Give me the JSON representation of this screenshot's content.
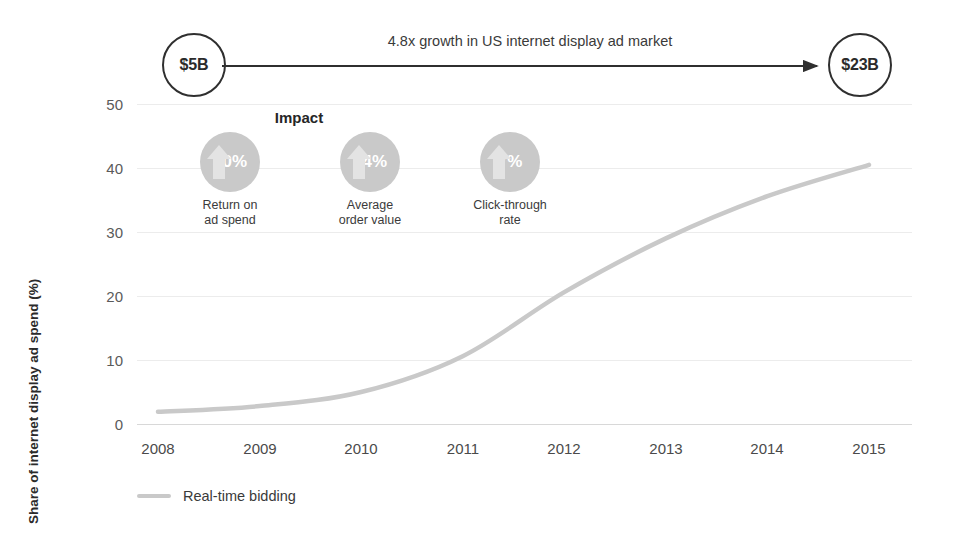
{
  "growth": {
    "start_label": "$5B",
    "end_label": "$23B",
    "caption": "4.8x growth in US internet display ad market"
  },
  "impact": {
    "title": "Impact",
    "items": [
      {
        "value": "30%",
        "label_line1": "Return on",
        "label_line2": "ad spend",
        "icon": "up-arrow-icon"
      },
      {
        "value": "24%",
        "label_line1": "Average",
        "label_line2": "order value",
        "icon": "up-arrow-icon"
      },
      {
        "value": "7%",
        "label_line1": "Click-through",
        "label_line2": "rate",
        "icon": "up-arrow-icon"
      }
    ]
  },
  "legend": {
    "entries": [
      {
        "label": "Real-time bidding",
        "color": "#c9c9c9"
      }
    ]
  },
  "axis": {
    "y_title": "Share of internet display ad spend (%)",
    "y_ticks": [
      "0",
      "10",
      "20",
      "30",
      "40",
      "50"
    ],
    "x_ticks": [
      "2008",
      "2009",
      "2010",
      "2011",
      "2012",
      "2013",
      "2014",
      "2015"
    ]
  },
  "colors": {
    "series_line": "#c9c9c9",
    "bubble_fill": "#c9c9c9",
    "arrow_fill": "#e3e3e3",
    "gridline": "#ececec",
    "annotation_stroke": "#2f2f2f",
    "text": "#3b3b3b"
  },
  "chart_data": {
    "type": "line",
    "title": "",
    "xlabel": "",
    "ylabel": "Share of internet display ad spend (%)",
    "categories": [
      "2008",
      "2009",
      "2010",
      "2011",
      "2012",
      "2013",
      "2014",
      "2015"
    ],
    "series": [
      {
        "name": "Real-time bidding",
        "color": "#c9c9c9",
        "values": [
          1.9,
          2.8,
          5.0,
          10.6,
          20.6,
          29.0,
          35.6,
          40.5
        ]
      }
    ],
    "ylim": [
      0,
      50
    ],
    "yticks": [
      0,
      10,
      20,
      30,
      40,
      50
    ],
    "grid": true,
    "legend_position": "bottom-left",
    "annotations": [
      {
        "kind": "arrow-callout",
        "text": "4.8x growth in US internet display ad market",
        "from_label": "$5B",
        "to_label": "$23B"
      },
      {
        "kind": "kpi",
        "title": "Impact",
        "value": "30%",
        "label": "Return on ad spend"
      },
      {
        "kind": "kpi",
        "title": "Impact",
        "value": "24%",
        "label": "Average order value"
      },
      {
        "kind": "kpi",
        "title": "Impact",
        "value": "7%",
        "label": "Click-through rate"
      }
    ]
  }
}
